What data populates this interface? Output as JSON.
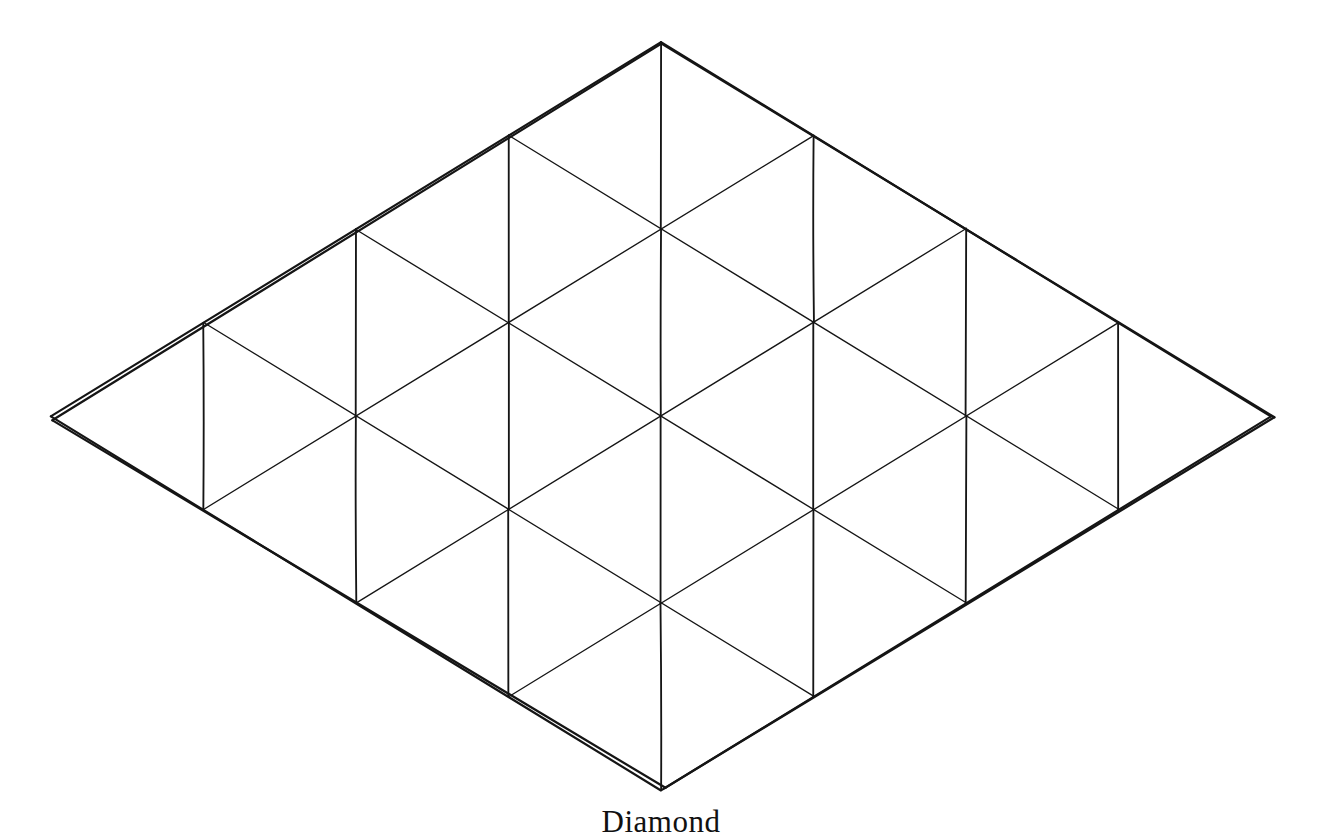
{
  "figure": {
    "caption": "Diamond",
    "title": "Diamond",
    "kind": "triangulated-rhombus-lattice",
    "ink_color": "#151515",
    "background_color": "#ffffff",
    "canvas": {
      "width": 1322,
      "height": 832
    }
  },
  "chart_data": {
    "type": "diagram",
    "title": "Diamond",
    "grid": {
      "rows": 4,
      "cols": 4,
      "cells": 16,
      "triangles": 32
    },
    "origin": {
      "x": 661,
      "y": 416
    },
    "basis_u": {
      "x": 152.5,
      "y": -93.5
    },
    "basis_v": {
      "x": 152.5,
      "y": 93.5
    },
    "index_range": [
      -2,
      -1,
      0,
      1,
      2
    ],
    "corners": {
      "top": {
        "x": 661,
        "y": 44
      },
      "left": {
        "x": 52,
        "y": 420
      },
      "right": {
        "x": 1274,
        "y": 417
      },
      "bottom": {
        "x": 665,
        "y": 788
      }
    },
    "edge_families": [
      {
        "name": "u-direction",
        "label": "up-right lines",
        "count": 5
      },
      {
        "name": "v-direction",
        "label": "down-right lines",
        "count": 5
      },
      {
        "name": "diagonal",
        "label": "cell diagonals (down-right, steeper)",
        "count": 16
      }
    ],
    "stroke_width_px": 1.7,
    "grid_visible": true,
    "legend": "none"
  }
}
